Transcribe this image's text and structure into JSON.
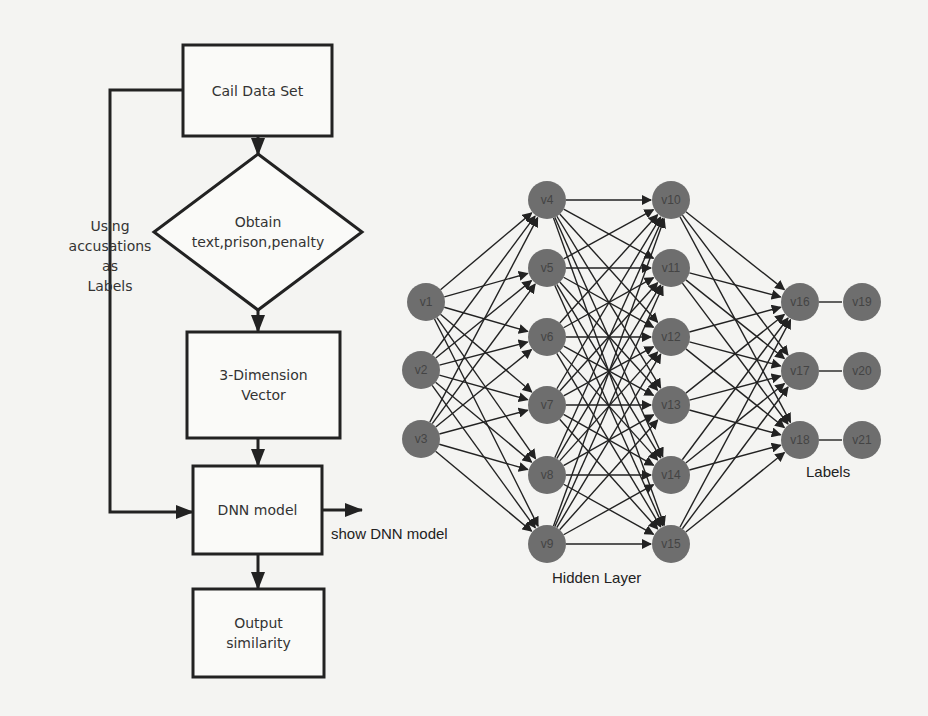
{
  "flowchart": {
    "nodes": [
      {
        "id": "cail",
        "shape": "rect",
        "lines": [
          "Cail Data Set"
        ],
        "x": 183,
        "y": 45,
        "w": 149,
        "h": 91
      },
      {
        "id": "obtain",
        "shape": "diamond",
        "lines": [
          "Obtain",
          "text,prison,penalty"
        ],
        "cx": 258,
        "cy": 232,
        "rx": 104,
        "ry": 78
      },
      {
        "id": "vector",
        "shape": "rect",
        "lines": [
          "3-Dimension",
          "Vector"
        ],
        "x": 187,
        "y": 332,
        "w": 153,
        "h": 106
      },
      {
        "id": "dnn",
        "shape": "rect",
        "lines": [
          "DNN model"
        ],
        "x": 193,
        "y": 466,
        "w": 129,
        "h": 88
      },
      {
        "id": "output",
        "shape": "rect",
        "lines": [
          "Output",
          "similarity"
        ],
        "x": 193,
        "y": 589,
        "w": 131,
        "h": 88
      }
    ],
    "side_label": [
      "Using",
      "accusations",
      "as",
      "Labels"
    ],
    "side_arrow_label": "show DNN model"
  },
  "network": {
    "node_color": "#6e6e6e",
    "radius": 19,
    "layers": [
      {
        "name": "input",
        "nodes": [
          {
            "id": "v1",
            "x": 426,
            "y": 302
          },
          {
            "id": "v2",
            "x": 421,
            "y": 370
          },
          {
            "id": "v3",
            "x": 421,
            "y": 439
          }
        ]
      },
      {
        "name": "hidden1",
        "nodes": [
          {
            "id": "v4",
            "x": 547,
            "y": 200
          },
          {
            "id": "v5",
            "x": 547,
            "y": 268
          },
          {
            "id": "v6",
            "x": 547,
            "y": 337
          },
          {
            "id": "v7",
            "x": 547,
            "y": 405
          },
          {
            "id": "v8",
            "x": 547,
            "y": 475
          },
          {
            "id": "v9",
            "x": 547,
            "y": 544
          }
        ]
      },
      {
        "name": "hidden2",
        "nodes": [
          {
            "id": "v10",
            "x": 671,
            "y": 200
          },
          {
            "id": "v11",
            "x": 671,
            "y": 268
          },
          {
            "id": "v12",
            "x": 671,
            "y": 337
          },
          {
            "id": "v13",
            "x": 671,
            "y": 405
          },
          {
            "id": "v14",
            "x": 671,
            "y": 475
          },
          {
            "id": "v15",
            "x": 671,
            "y": 544
          }
        ]
      },
      {
        "name": "output",
        "nodes": [
          {
            "id": "v16",
            "x": 800,
            "y": 302
          },
          {
            "id": "v17",
            "x": 800,
            "y": 371
          },
          {
            "id": "v18",
            "x": 800,
            "y": 440
          }
        ]
      },
      {
        "name": "labels",
        "nodes": [
          {
            "id": "v19",
            "x": 862,
            "y": 302
          },
          {
            "id": "v20",
            "x": 862,
            "y": 371
          },
          {
            "id": "v21",
            "x": 862,
            "y": 440
          }
        ]
      }
    ],
    "captions": {
      "hidden_layer": "Hidden Layer",
      "labels": "Labels"
    }
  }
}
